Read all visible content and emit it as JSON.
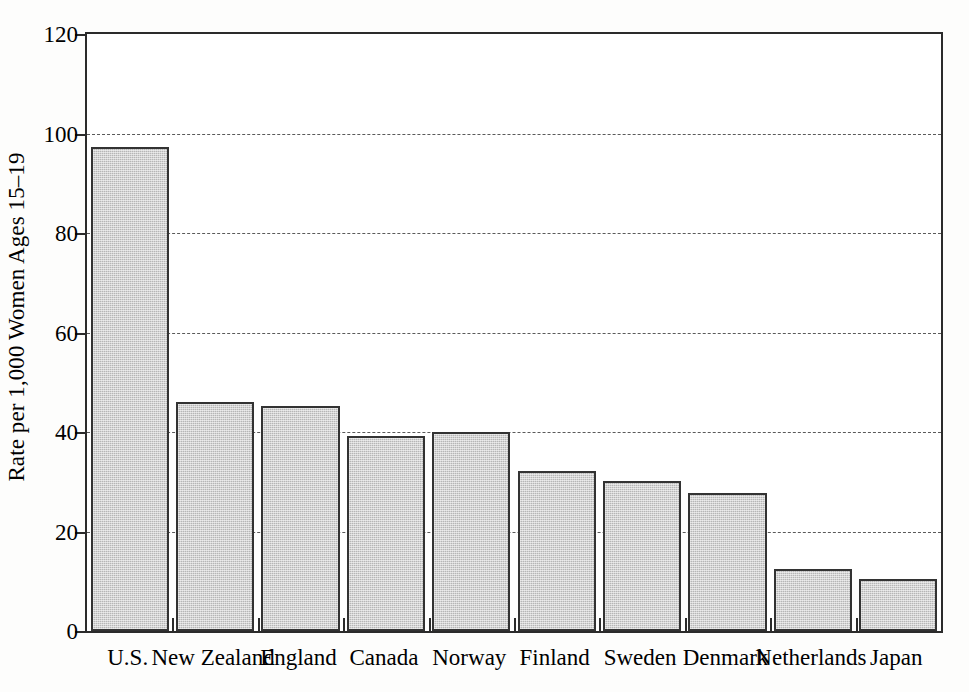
{
  "chart_data": {
    "type": "bar",
    "title": "",
    "subtitle": "",
    "xlabel": "",
    "ylabel": "Rate per 1,000 Women Ages 15–19",
    "ylim": [
      0,
      120
    ],
    "ytick_values": [
      0,
      20,
      40,
      60,
      80,
      100,
      120
    ],
    "ytick_labels": [
      "0",
      "20",
      "40",
      "60",
      "80",
      "100",
      "120"
    ],
    "grid": "horizontal-dashed",
    "gridline_values": [
      20,
      40,
      60,
      80,
      100
    ],
    "legend": null,
    "legend_position": "none",
    "bar_color": "#b6b6b6",
    "bar_edge_color": "#333333",
    "axis_color": "#2b2b2b",
    "categories": [
      "U.S.",
      "New Zealand",
      "England",
      "Canada",
      "Norway",
      "Finland",
      "Sweden",
      "Denmark",
      "Netherlands",
      "Japan"
    ],
    "values": [
      97.2,
      46.1,
      45.2,
      39.1,
      40.1,
      32.1,
      30.1,
      27.8,
      12.4,
      10.5
    ],
    "annotations": []
  },
  "figure": {
    "background": "#fdfdfc"
  }
}
